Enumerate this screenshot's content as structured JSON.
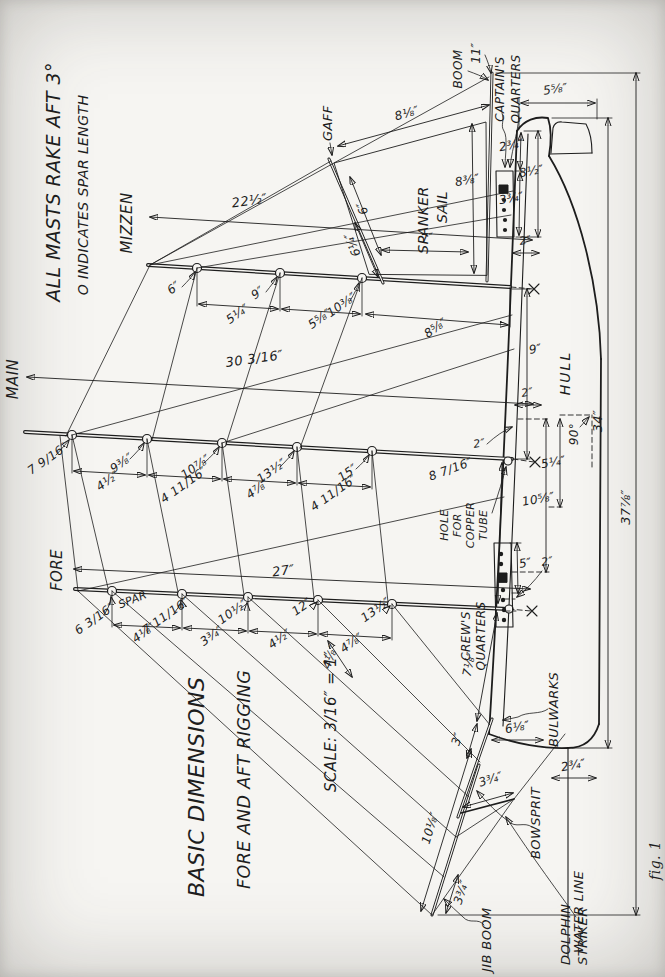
{
  "page": {
    "figure_caption": "fig. 1"
  },
  "title_block": {
    "line1": "BASIC DIMENSIONS",
    "line2": "FORE AND AFT RIGGING",
    "scale": "SCALE: 3/16″ = 1″"
  },
  "notes": {
    "rake_note": "ALL MASTS RAKE AFT 3°",
    "spar_note": "O INDICATES SPAR LENGTH"
  },
  "masts": {
    "fore": {
      "name": "FORE",
      "spar_word": "SPAR",
      "length": "27″",
      "spar_lengths": [
        "6 3/16″",
        "7 11/16″",
        "10½″",
        "12″",
        "13½″"
      ],
      "spacings": [
        "4⅛″",
        "3¾″",
        "4½″",
        "4⅞″"
      ]
    },
    "main": {
      "name": "MAIN",
      "length": "30 3/16″",
      "spar_lengths": [
        "7 9/16″",
        "9⅜″",
        "10⅞″",
        "13½″",
        "15″"
      ],
      "spacings": [
        "4½″",
        "4 11/16″",
        "4⅞″",
        "4 11/16″"
      ]
    },
    "mizzen": {
      "name": "MIZZEN",
      "length": "22½″",
      "spar_lengths": [
        "6″",
        "9″",
        "10⅜″"
      ],
      "spacings": [
        "5¼″",
        "5⅝″",
        "8⅝″"
      ]
    }
  },
  "spanker": {
    "label1": "SPANKER",
    "label2": "SAIL",
    "gaff_label": "GAFF",
    "gaff_lower": "6¼″",
    "head": "6″",
    "luff": "7″",
    "leech": "8⅛″",
    "foot": "8⅜″",
    "boom_label": "BOOM",
    "boom_length": "11″"
  },
  "stern": {
    "captains1": "CAPTAIN'S",
    "captains2": "QUARTERS",
    "house_length": "3¾″",
    "house_to_stern": "2¾″",
    "overall_aft": "8½″",
    "step_depth": "2″",
    "counter_height": "5⅝″",
    "main_to_mizzen": "9″"
  },
  "midship": {
    "hull_label": "HULL",
    "hole_line1": "HOLE",
    "hole_line2": "FOR",
    "hole_line3": "COPPER",
    "hole_line4": "TUBE",
    "fore_to_main": "8 7/16″",
    "step_depth": "2″",
    "step_note": "2″",
    "keel_dim1": "10⅝″",
    "keel_dim2": "5¼″",
    "right_angle": "90°"
  },
  "crew": {
    "label1": "CREW'S",
    "label2": "QUARTERS",
    "house_length": "5″",
    "hatch": "2″"
  },
  "bow": {
    "bulwarks": "BULWARKS",
    "bowsprit": "BOWSPRIT",
    "jib_boom": "JIB BOOM",
    "dolphin1": "DOLPHIN",
    "dolphin2": "STRIKER",
    "water_line": "WATER LINE",
    "heel_to_mast": "7⅛″",
    "sprit_gap": "3″",
    "stay_gap": "4⅛″",
    "bow_height": "6⅛″",
    "stem_to_waterline": "2¾″",
    "jib_length": "10⅛″",
    "tip_gap": "3¾″",
    "striker_length": "3¾″"
  },
  "overall": {
    "hull_length": "34″",
    "overall_length": "37⅞″"
  }
}
